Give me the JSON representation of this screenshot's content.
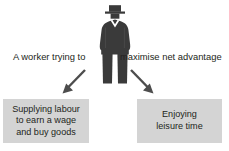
{
  "diagram": {
    "title_text": "A worker trying to maximise net advantage",
    "headline": {
      "left_part": "A worker trying to",
      "right_part": "maximise net advantage"
    },
    "figure": {
      "label": "worker-silhouette",
      "description": "Standing man wearing a hat and suit",
      "body_color": "#3a3a3a",
      "shirt_color": "#ffffff"
    },
    "arrows": [
      {
        "name": "arrow-to-supplying-labour",
        "direction": "down-left",
        "color": "#4d4d4d"
      },
      {
        "name": "arrow-to-enjoying-leisure",
        "direction": "down-right",
        "color": "#4d4d4d"
      }
    ],
    "boxes": [
      {
        "name": "supplying-labour",
        "lines": [
          "Supplying labour",
          "to earn a wage",
          "and buy goods"
        ],
        "fill_color": "#d4d4d4",
        "text_color": "#231f20"
      },
      {
        "name": "enjoying-leisure",
        "lines": [
          "Enjoying",
          "leisure time"
        ],
        "fill_color": "#d4d4d4",
        "text_color": "#231f20"
      }
    ]
  }
}
